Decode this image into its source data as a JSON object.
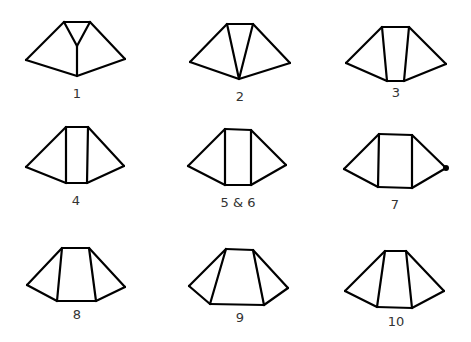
{
  "figures": [
    {
      "label": "1",
      "label_pos": [
        77,
        98
      ],
      "edges": [
        [
          64,
          22,
          90,
          22
        ],
        [
          64,
          22,
          26,
          60
        ],
        [
          90,
          22,
          125,
          59
        ],
        [
          26,
          60,
          77,
          76
        ],
        [
          125,
          59,
          77,
          76
        ],
        [
          64,
          22,
          77,
          46
        ],
        [
          90,
          22,
          77,
          46
        ],
        [
          77,
          46,
          77,
          76
        ]
      ],
      "dots": []
    },
    {
      "label": "2",
      "label_pos": [
        240,
        101
      ],
      "edges": [
        [
          227,
          24,
          253,
          24
        ],
        [
          227,
          24,
          190,
          62
        ],
        [
          253,
          24,
          290,
          63
        ],
        [
          190,
          62,
          239,
          79
        ],
        [
          290,
          63,
          239,
          79
        ],
        [
          227,
          24,
          239,
          79
        ],
        [
          253,
          24,
          239,
          79
        ]
      ],
      "dots": []
    },
    {
      "label": "3",
      "label_pos": [
        396,
        97
      ],
      "edges": [
        [
          382,
          27,
          409,
          27
        ],
        [
          382,
          27,
          346,
          63
        ],
        [
          409,
          27,
          446,
          64
        ],
        [
          346,
          63,
          387,
          81
        ],
        [
          446,
          64,
          404,
          81
        ],
        [
          387,
          81,
          404,
          81
        ],
        [
          382,
          27,
          387,
          81
        ],
        [
          409,
          27,
          404,
          81
        ]
      ],
      "dots": []
    },
    {
      "label": "4",
      "label_pos": [
        76,
        205
      ],
      "edges": [
        [
          66,
          127,
          88,
          127
        ],
        [
          66,
          127,
          26,
          167
        ],
        [
          88,
          127,
          124,
          166
        ],
        [
          26,
          167,
          66,
          183
        ],
        [
          124,
          166,
          87,
          183
        ],
        [
          66,
          183,
          87,
          183
        ],
        [
          66,
          127,
          66,
          183
        ],
        [
          88,
          127,
          87,
          183
        ]
      ],
      "dots": []
    },
    {
      "label": "5 & 6",
      "label_pos": [
        238,
        207
      ],
      "edges": [
        [
          225,
          129,
          251,
          130
        ],
        [
          225,
          129,
          188,
          166
        ],
        [
          251,
          130,
          286,
          165
        ],
        [
          188,
          166,
          225,
          185
        ],
        [
          286,
          165,
          251,
          185
        ],
        [
          225,
          185,
          251,
          185
        ],
        [
          225,
          129,
          225,
          185
        ],
        [
          251,
          130,
          251,
          185
        ]
      ],
      "dots": []
    },
    {
      "label": "7",
      "label_pos": [
        395,
        209
      ],
      "edges": [
        [
          379,
          134,
          412,
          135
        ],
        [
          379,
          134,
          344,
          169
        ],
        [
          412,
          135,
          446,
          168
        ],
        [
          344,
          169,
          378,
          187
        ],
        [
          446,
          168,
          412,
          188
        ],
        [
          378,
          187,
          412,
          188
        ],
        [
          379,
          134,
          378,
          187
        ],
        [
          412,
          135,
          412,
          188
        ]
      ],
      "dots": [
        [
          446,
          168
        ]
      ]
    },
    {
      "label": "8",
      "label_pos": [
        77,
        319
      ],
      "edges": [
        [
          62,
          248,
          89,
          248
        ],
        [
          62,
          248,
          27,
          285
        ],
        [
          89,
          248,
          125,
          287
        ],
        [
          27,
          285,
          57,
          301
        ],
        [
          125,
          287,
          96,
          301
        ],
        [
          57,
          301,
          96,
          301
        ],
        [
          62,
          248,
          57,
          301
        ],
        [
          89,
          248,
          96,
          301
        ]
      ],
      "dots": []
    },
    {
      "label": "9",
      "label_pos": [
        240,
        322
      ],
      "edges": [
        [
          226,
          249,
          253,
          250
        ],
        [
          226,
          249,
          189,
          286
        ],
        [
          253,
          250,
          288,
          288
        ],
        [
          189,
          286,
          210,
          304
        ],
        [
          288,
          288,
          264,
          305
        ],
        [
          210,
          304,
          264,
          305
        ],
        [
          226,
          249,
          210,
          304
        ],
        [
          253,
          250,
          264,
          305
        ]
      ],
      "dots": []
    },
    {
      "label": "10",
      "label_pos": [
        396,
        326
      ],
      "edges": [
        [
          385,
          251,
          406,
          251
        ],
        [
          385,
          251,
          345,
          291
        ],
        [
          406,
          251,
          444,
          291
        ],
        [
          345,
          291,
          377,
          307
        ],
        [
          444,
          291,
          412,
          308
        ],
        [
          377,
          307,
          412,
          308
        ],
        [
          385,
          251,
          377,
          307
        ],
        [
          406,
          251,
          412,
          308
        ]
      ],
      "dots": []
    }
  ]
}
